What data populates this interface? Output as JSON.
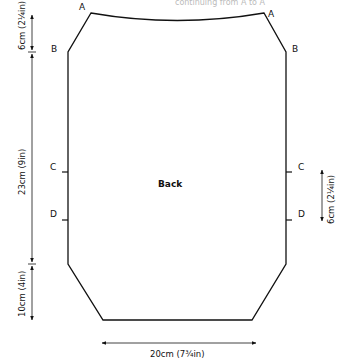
{
  "diagram": {
    "title": "Back",
    "cutoff_text": "continuing from A to A",
    "points": {
      "A_left": "A",
      "A_right": "A",
      "B_left": "B",
      "B_right": "B",
      "C_left": "C",
      "C_right": "C",
      "D_left": "D",
      "D_right": "D"
    },
    "dimensions": {
      "left_top": "6cm (2¼in)",
      "left_middle": "23cm (9in)",
      "left_bottom": "10cm (4in)",
      "right_cd": "6cm (2¼in)",
      "bottom_width": "20cm (7¾in)"
    },
    "colors": {
      "line": "#111111",
      "background": "#ffffff"
    }
  }
}
